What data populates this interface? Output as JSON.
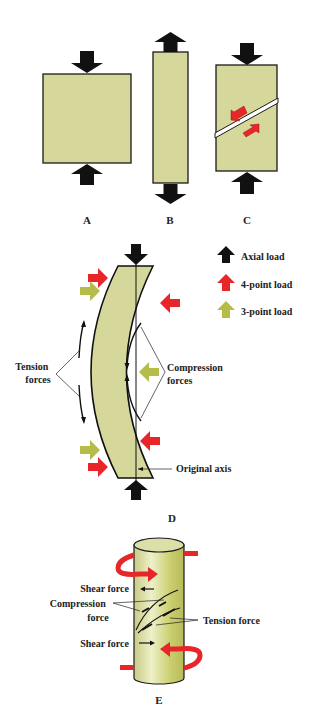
{
  "colors": {
    "material": "#d6d79a",
    "material_edge": "#1a1a1a",
    "axial": "#111111",
    "four_point": "#e8262a",
    "three_point": "#b5bc4a",
    "text": "#222222"
  },
  "panels": {
    "a": {
      "label": "A",
      "desc": "compression"
    },
    "b": {
      "label": "B",
      "desc": "tension"
    },
    "c": {
      "label": "C",
      "desc": "shear"
    },
    "d": {
      "label": "D",
      "desc": "bending"
    },
    "e": {
      "label": "E",
      "desc": "torsion"
    }
  },
  "legend": {
    "items": [
      {
        "icon": "black-up-arrow-icon",
        "label": "Axial load"
      },
      {
        "icon": "red-up-arrow-icon",
        "label": "4-point load"
      },
      {
        "icon": "olive-up-arrow-icon",
        "label": "3-point load"
      }
    ]
  },
  "d_labels": {
    "tension_line1": "Tension",
    "tension_line2": "forces",
    "compression_line1": "Compression",
    "compression_line2": "forces",
    "original_axis": "Original axis"
  },
  "e_labels": {
    "shear_top": "Shear force",
    "compression_line1": "Compression",
    "compression_line2": "force",
    "tension": "Tension force",
    "shear_bottom": "Shear force"
  }
}
